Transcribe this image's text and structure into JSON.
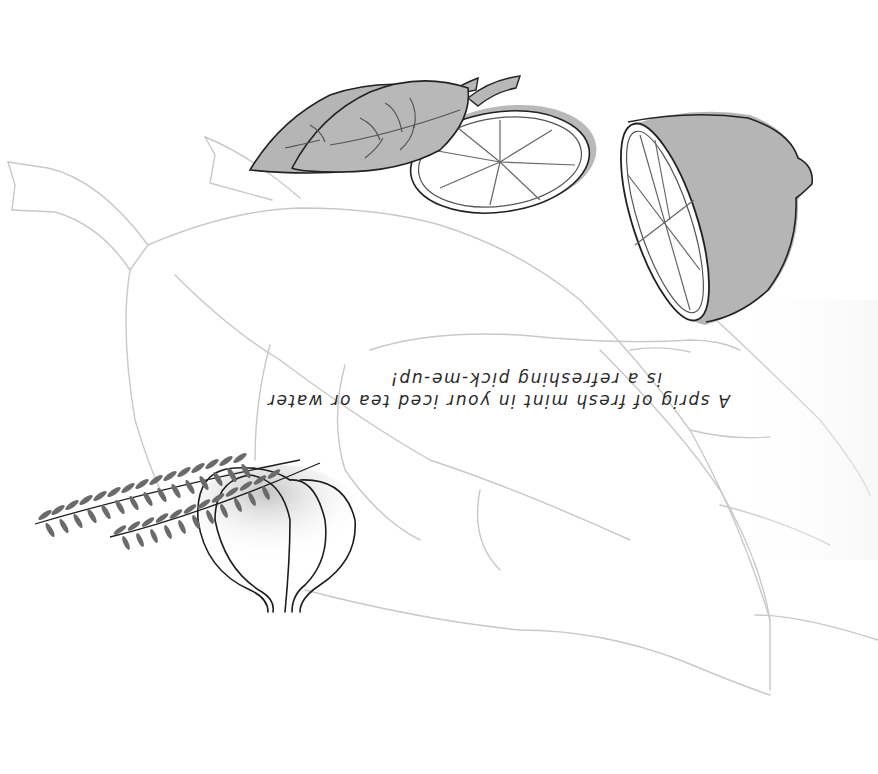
{
  "page": {
    "orientation": "rotated-180",
    "background": "#ffffff"
  },
  "caption": {
    "line1": "A sprig of fresh mint in your iced tea or water",
    "line2": "is a refreshing pick-me-up!"
  },
  "illustration": {
    "elements": [
      {
        "name": "background-mint-leaves",
        "style": "light-gray outline"
      },
      {
        "name": "mint-leaves-pair",
        "style": "gray fill, dark outline"
      },
      {
        "name": "lemon-slice",
        "style": "white with segments"
      },
      {
        "name": "lemon-half",
        "style": "gray rind, segmented face"
      },
      {
        "name": "garlic-bulb",
        "style": "outline with gray shading"
      },
      {
        "name": "herb-sprigs",
        "style": "dark gray leaflets"
      }
    ]
  },
  "colors": {
    "outline_light": "#c4c4c4",
    "outline_dark": "#222222",
    "fill_gray": "#b7b7b7",
    "herb_gray": "#6a6a6a",
    "text": "#2a2a2a"
  }
}
